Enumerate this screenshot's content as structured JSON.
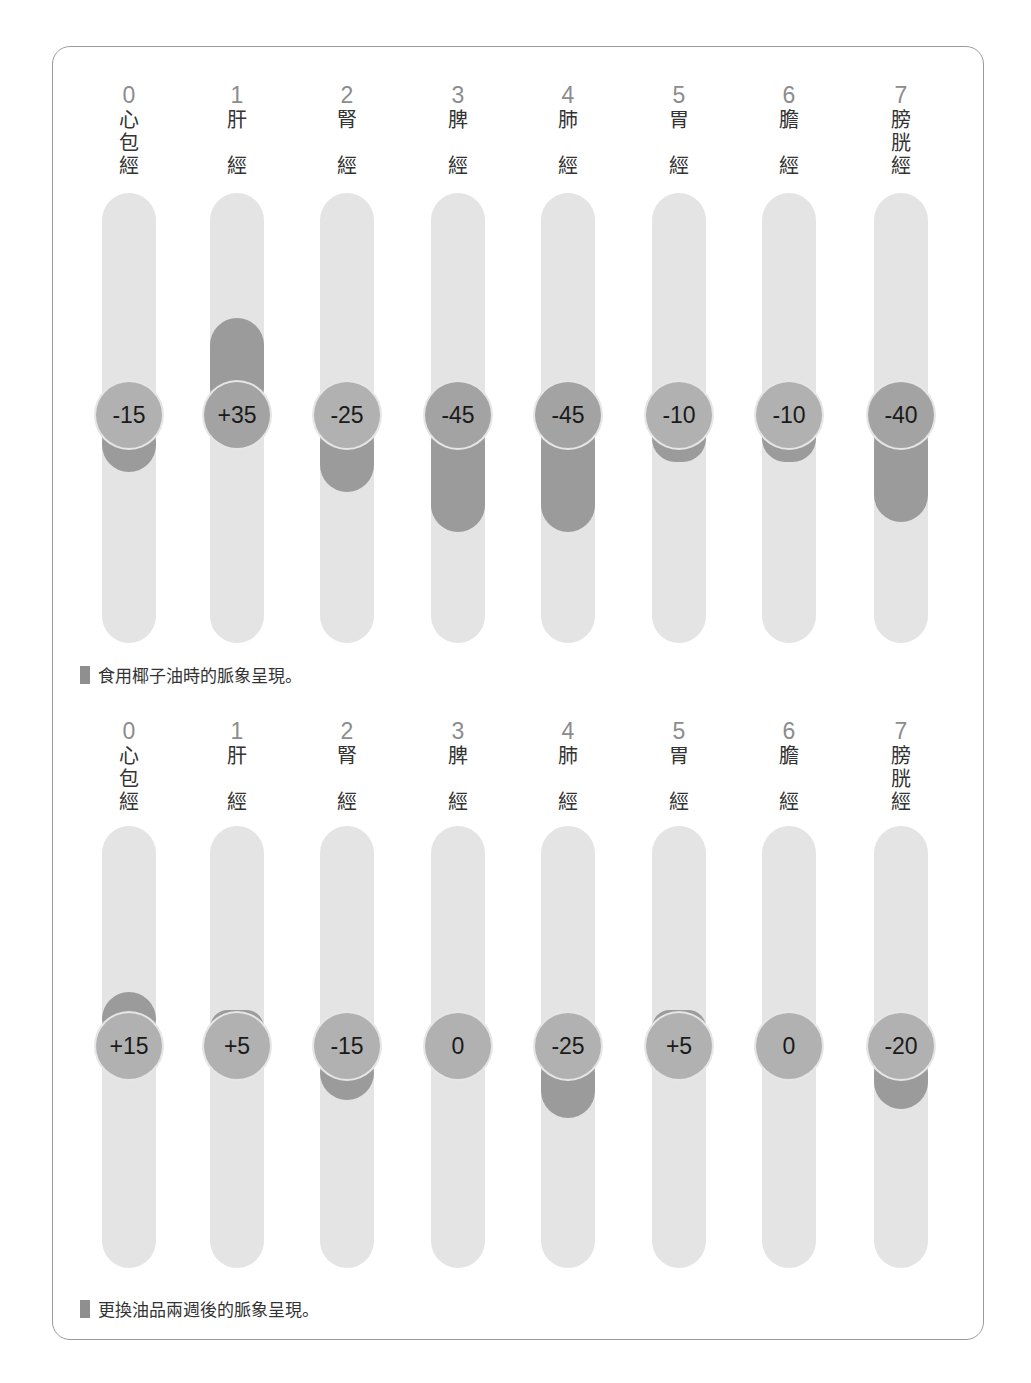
{
  "chart_data": [
    {
      "type": "bar",
      "title": "食用椰子油時的脈象呈現。",
      "categories": [
        "心包經",
        "肝經",
        "腎經",
        "脾經",
        "肺經",
        "胃經",
        "膽經",
        "膀胱經"
      ],
      "indices": [
        "0",
        "1",
        "2",
        "3",
        "4",
        "5",
        "6",
        "7"
      ],
      "values": [
        -15,
        35,
        -25,
        -45,
        -45,
        -10,
        -10,
        -40
      ],
      "labels": [
        "-15",
        "+35",
        "-25",
        "-45",
        "-45",
        "-10",
        "-10",
        "-40"
      ],
      "ylim": [
        -100,
        100
      ],
      "grid": false
    },
    {
      "type": "bar",
      "title": "更換油品兩週後的脈象呈現。",
      "categories": [
        "心包經",
        "肝經",
        "腎經",
        "脾經",
        "肺經",
        "胃經",
        "膽經",
        "膀胱經"
      ],
      "indices": [
        "0",
        "1",
        "2",
        "3",
        "4",
        "5",
        "6",
        "7"
      ],
      "values": [
        15,
        5,
        -15,
        0,
        -25,
        5,
        0,
        -20
      ],
      "labels": [
        "+15",
        "+5",
        "-15",
        "0",
        "-25",
        "+5",
        "0",
        "-20"
      ],
      "ylim": [
        -100,
        100
      ],
      "grid": false
    }
  ],
  "charts": [
    {
      "caption": "食用椰子油時的脈象呈現。",
      "columns": [
        {
          "index": "0",
          "name": [
            "心",
            "包",
            "經"
          ],
          "value": -15,
          "label": "-15"
        },
        {
          "index": "1",
          "name": [
            "肝",
            "",
            "經"
          ],
          "value": 35,
          "label": "+35"
        },
        {
          "index": "2",
          "name": [
            "腎",
            "",
            "經"
          ],
          "value": -25,
          "label": "-25"
        },
        {
          "index": "3",
          "name": [
            "脾",
            "",
            "經"
          ],
          "value": -45,
          "label": "-45"
        },
        {
          "index": "4",
          "name": [
            "肺",
            "",
            "經"
          ],
          "value": -45,
          "label": "-45"
        },
        {
          "index": "5",
          "name": [
            "胃",
            "",
            "經"
          ],
          "value": -10,
          "label": "-10"
        },
        {
          "index": "6",
          "name": [
            "膽",
            "",
            "經"
          ],
          "value": -10,
          "label": "-10"
        },
        {
          "index": "7",
          "name": [
            "膀",
            "胱",
            "經"
          ],
          "value": -40,
          "label": "-40"
        }
      ]
    },
    {
      "caption": "更換油品兩週後的脈象呈現。",
      "columns": [
        {
          "index": "0",
          "name": [
            "心",
            "包",
            "經"
          ],
          "value": 15,
          "label": "+15"
        },
        {
          "index": "1",
          "name": [
            "肝",
            "",
            "經"
          ],
          "value": 5,
          "label": "+5"
        },
        {
          "index": "2",
          "name": [
            "腎",
            "",
            "經"
          ],
          "value": -15,
          "label": "-15"
        },
        {
          "index": "3",
          "name": [
            "脾",
            "",
            "經"
          ],
          "value": 0,
          "label": "0"
        },
        {
          "index": "4",
          "name": [
            "肺",
            "",
            "經"
          ],
          "value": -25,
          "label": "-25"
        },
        {
          "index": "5",
          "name": [
            "胃",
            "",
            "經"
          ],
          "value": 5,
          "label": "+5"
        },
        {
          "index": "6",
          "name": [
            "膽",
            "",
            "經"
          ],
          "value": 0,
          "label": "0"
        },
        {
          "index": "7",
          "name": [
            "膀",
            "胱",
            "經"
          ],
          "value": -20,
          "label": "-20"
        }
      ]
    }
  ],
  "colors": {
    "track": "#e4e4e4",
    "bar": "#9b9b9b",
    "knob": "#b1b1b1",
    "index_text": "#8c8c8c",
    "frame": "#9a9a9a"
  }
}
